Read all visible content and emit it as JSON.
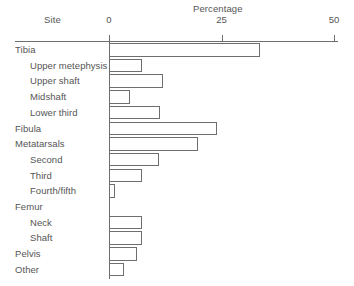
{
  "chart_data": {
    "type": "bar",
    "orientation": "horizontal",
    "title": "",
    "xlabel": "Percentage",
    "ylabel": "Site",
    "xlim": [
      0,
      50
    ],
    "xticks": [
      0,
      25,
      50
    ],
    "xtick_labels": [
      "0",
      "25",
      "50"
    ],
    "grid": false,
    "legend": false,
    "categories": [
      "Tibia",
      "Upper metephysis",
      "Upper shaft",
      "Midshaft",
      "Lower third",
      "Fibula",
      "Metatarsals",
      "Second",
      "Third",
      "Fourth/fifth",
      "Femur",
      "Neck",
      "Shaft",
      "Pelvis",
      "Other"
    ],
    "values": [
      33.5,
      7.3,
      12.0,
      4.7,
      11.3,
      24.0,
      19.8,
      11.1,
      7.3,
      1.3,
      0.2,
      7.3,
      7.3,
      6.2,
      3.3
    ],
    "indent_levels": [
      0,
      1,
      1,
      1,
      1,
      0,
      0,
      1,
      1,
      1,
      0,
      1,
      1,
      0,
      0
    ],
    "colors": {
      "bar_outline": "#6e6e6e",
      "bar_fill": "transparent",
      "axis": "#6e6e6e",
      "text": "#555555",
      "background": "#ffffff"
    }
  },
  "axis": {
    "site_header": "Site",
    "percentage_header": "Percentage"
  }
}
